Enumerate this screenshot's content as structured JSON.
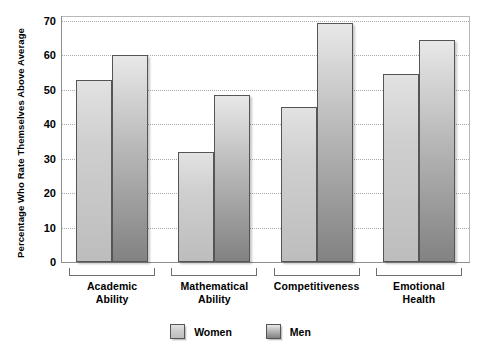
{
  "chart_data": {
    "type": "bar",
    "title": "",
    "subtitle": "",
    "xlabel": "",
    "ylabel": "Percentage Who Rate Themselves Above Average",
    "categories": [
      "Academic Ability",
      "Mathematical Ability",
      "Competitiveness",
      "Emotional Health"
    ],
    "category_lines": [
      [
        "Academic",
        "Ability"
      ],
      [
        "Mathematical",
        "Ability"
      ],
      [
        "Competitiveness"
      ],
      [
        "Emotional",
        "Health"
      ]
    ],
    "series": [
      {
        "name": "Women",
        "values": [
          53,
          32,
          45,
          54.5
        ],
        "color": "#cfcfcf"
      },
      {
        "name": "Men",
        "values": [
          60,
          48.5,
          69.5,
          64.5
        ],
        "color": "#b0b0b0"
      }
    ],
    "ylim": [
      0,
      70
    ],
    "yticks": [
      0,
      10,
      20,
      30,
      40,
      50,
      60,
      70
    ],
    "ytick_labels": [
      "0",
      "10",
      "20",
      "30",
      "40",
      "50",
      "60",
      "70"
    ],
    "grid": true,
    "grid_style": "dotted",
    "legend_position": "bottom-center",
    "legend_entries": [
      "Women",
      "Men"
    ]
  }
}
